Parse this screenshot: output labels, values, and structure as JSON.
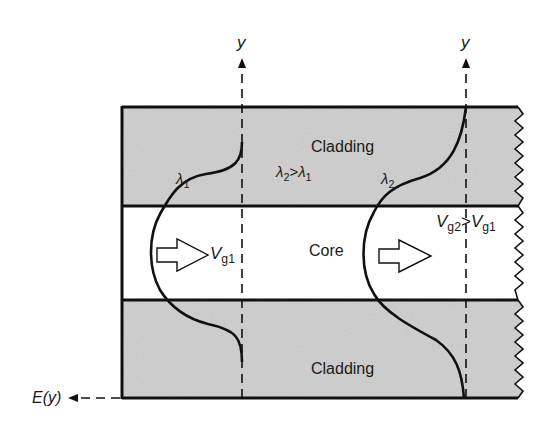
{
  "diagram": {
    "type": "optical-waveguide-cross-section",
    "regions": {
      "cladding_top": "Cladding",
      "core": "Core",
      "cladding_bottom": "Cladding"
    },
    "axes": {
      "left_y_label": "y",
      "right_y_label": "y",
      "field_axis_label": "E(y)"
    },
    "modes": [
      {
        "wavelength": "λ",
        "wavelength_sub": "1",
        "velocity": "V",
        "velocity_sub": "g1"
      },
      {
        "wavelength": "λ",
        "wavelength_sub": "2"
      }
    ],
    "relations": {
      "wavelength": {
        "lhs": "λ",
        "lhs_sub": "2",
        "op": ">",
        "rhs": "λ",
        "rhs_sub": "1"
      },
      "velocity": {
        "lhs": "V",
        "lhs_sub": "g2",
        "op": ">",
        "rhs": "V",
        "rhs_sub": "g1"
      }
    },
    "colors": {
      "line": "#111111",
      "cladding_fill": "#c9c9c9",
      "core_fill": "#ffffff",
      "background": "#ffffff"
    }
  }
}
